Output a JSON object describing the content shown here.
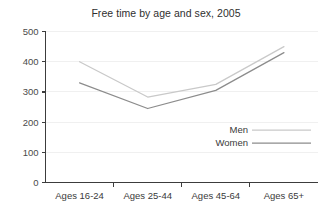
{
  "chart_data": {
    "type": "line",
    "title": "Free time by age and sex, 2005",
    "xlabel": "",
    "ylabel": "",
    "categories": [
      "Ages 16-24",
      "Ages 25-44",
      "Ages 45-64",
      "Ages 65+"
    ],
    "series": [
      {
        "name": "Men",
        "values": [
          400,
          283,
          325,
          450
        ],
        "color": "#c9c9c9"
      },
      {
        "name": "Women",
        "values": [
          330,
          245,
          305,
          430
        ],
        "color": "#8c8c8c"
      }
    ],
    "ylim": [
      0,
      500
    ],
    "ytick_values": [
      0,
      100,
      200,
      300,
      400,
      500
    ],
    "ytick_labels": [
      "0",
      "100",
      "200",
      "300",
      "400",
      "500"
    ],
    "grid": true,
    "grid_color": "#f0f0f0",
    "legend_position": "inside lower-right",
    "axis_color": "#3c3c3c",
    "background_color": "#ffffff"
  }
}
